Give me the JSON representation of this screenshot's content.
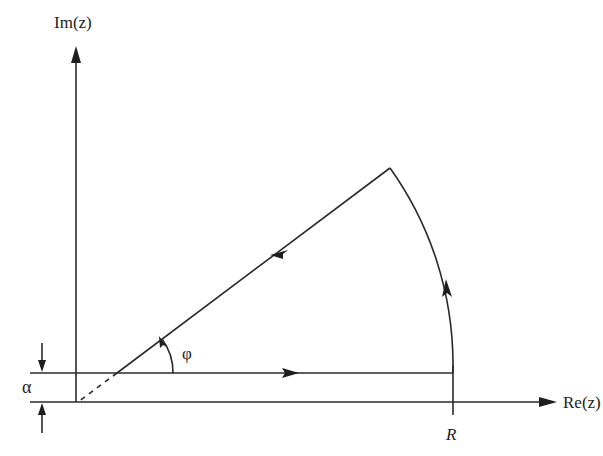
{
  "diagram": {
    "type": "contour-integration-wedge",
    "labels": {
      "imag_axis": "Im(z)",
      "real_axis": "Re(z)",
      "radius": "R",
      "angle": "φ",
      "offset": "α"
    },
    "colors": {
      "stroke": "#2a2a2a",
      "background": "#ffffff"
    },
    "contour_segments": [
      {
        "name": "horizontal-segment",
        "direction": "rightward",
        "description": "line at height α from the wedge vertex to R"
      },
      {
        "name": "arc-segment",
        "direction": "counterclockwise",
        "description": "circular arc of radius R from angle 0 to φ"
      },
      {
        "name": "ray-segment",
        "direction": "inward",
        "description": "ray at angle φ back toward the vertex"
      },
      {
        "name": "dashed-extension",
        "style": "dashed",
        "description": "extension of ray down to the origin"
      }
    ]
  }
}
